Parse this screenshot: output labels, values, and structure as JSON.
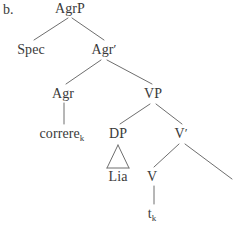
{
  "figure": {
    "label": "b.",
    "type": "syntax-tree"
  },
  "colors": {
    "background": "#ffffff",
    "text": "#3a3a3a",
    "line": "#6e6e6e"
  },
  "nodes": {
    "agrp": {
      "label": "AgrP"
    },
    "spec": {
      "label": "Spec"
    },
    "agr_bar": {
      "label": "Agr",
      "prime": "′"
    },
    "agr": {
      "label": "Agr"
    },
    "vp": {
      "label": "VP"
    },
    "correre": {
      "label": "correre",
      "subscript": "k"
    },
    "dp": {
      "label": "DP"
    },
    "v_bar": {
      "label": "V",
      "prime": "′"
    },
    "lia": {
      "label": "Lia"
    },
    "v": {
      "label": "V"
    },
    "trace": {
      "label": "t",
      "subscript": "k"
    }
  },
  "tree_structure": {
    "root": "AgrP",
    "edges": [
      {
        "from": "AgrP",
        "to": "Spec"
      },
      {
        "from": "AgrP",
        "to": "Agr′"
      },
      {
        "from": "Agr′",
        "to": "Agr"
      },
      {
        "from": "Agr′",
        "to": "VP"
      },
      {
        "from": "Agr",
        "to": "correre_k"
      },
      {
        "from": "VP",
        "to": "DP"
      },
      {
        "from": "VP",
        "to": "V′"
      },
      {
        "from": "DP",
        "to": "Lia",
        "shape": "triangle"
      },
      {
        "from": "V′",
        "to": "V"
      },
      {
        "from": "V′",
        "to": "unlabeled-right-branch"
      },
      {
        "from": "V",
        "to": "t_k"
      }
    ]
  }
}
